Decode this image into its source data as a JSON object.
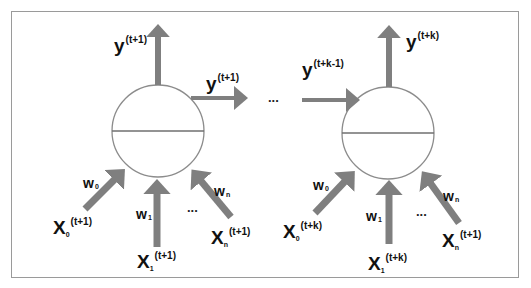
{
  "diagram": {
    "title": "",
    "colors": {
      "arrow": "#7f7f7f",
      "circle_stroke": "#8c8c8c",
      "frame_border": "#9a9a9a",
      "text": "#111111"
    },
    "neuron_left": {
      "output_up_label": {
        "base": "y",
        "sup": "(t+1)"
      },
      "output_right_label": {
        "base": "y",
        "sup": "(t+1)"
      },
      "inputs": [
        {
          "weight": {
            "base": "w",
            "sub": "0"
          },
          "x": {
            "base": "X",
            "sub": "0",
            "sup": "(t+1)"
          }
        },
        {
          "weight": {
            "base": "w",
            "sub": "1"
          },
          "x": {
            "base": "X",
            "sub": "1",
            "sup": "(t+1)"
          }
        },
        {
          "weight": {
            "base": "w",
            "sub": "n"
          },
          "x": {
            "base": "X",
            "sub": "n",
            "sup": "(t+1)"
          }
        }
      ],
      "ellipsis": "..."
    },
    "between_ellipsis": "...",
    "neuron_right": {
      "input_left_label": {
        "base": "y",
        "sup": "(t+k-1)"
      },
      "output_up_label": {
        "base": "y",
        "sup": "(t+k)"
      },
      "inputs": [
        {
          "weight": {
            "base": "w",
            "sub": "0"
          },
          "x": {
            "base": "X",
            "sub": "0",
            "sup": "(t+k)"
          }
        },
        {
          "weight": {
            "base": "w",
            "sub": "1"
          },
          "x": {
            "base": "X",
            "sub": "1",
            "sup": "(t+k)"
          }
        },
        {
          "weight": {
            "base": "w",
            "sub": "n"
          },
          "x": {
            "base": "X",
            "sub": "n",
            "sup": "(t+1)"
          }
        }
      ],
      "ellipsis": "..."
    }
  }
}
